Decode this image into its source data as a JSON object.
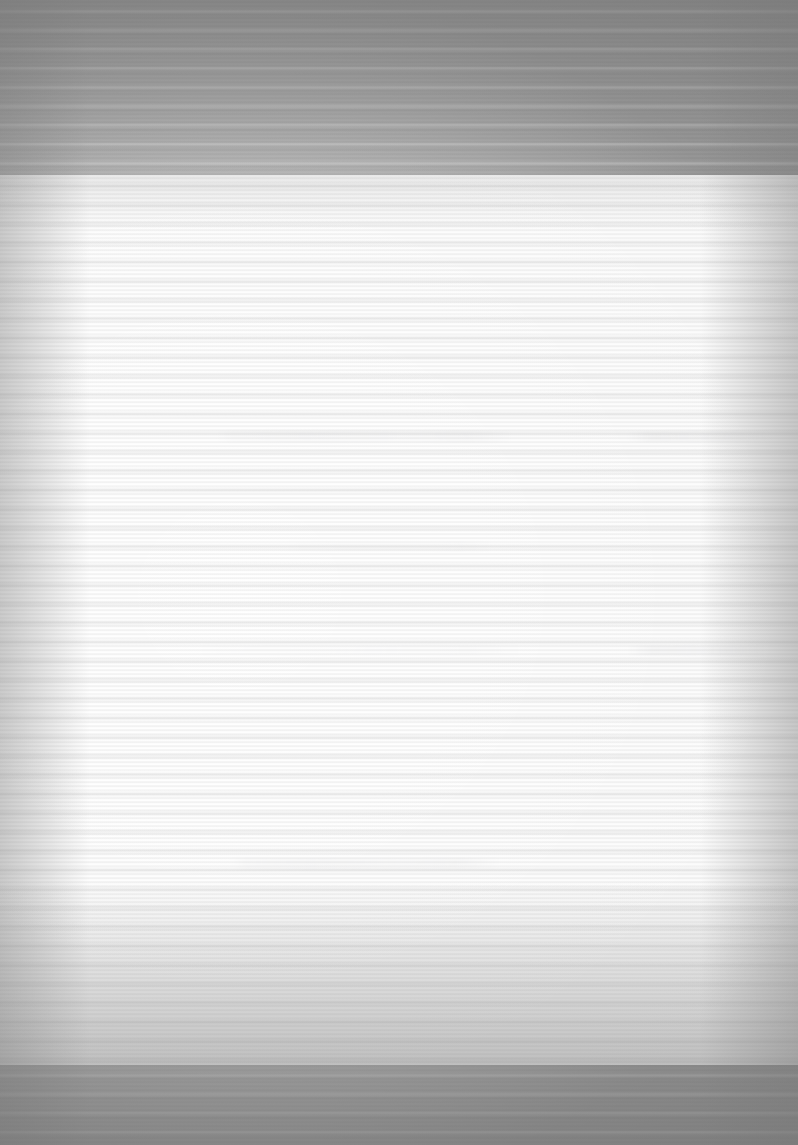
{
  "capture": {
    "width_px": 798,
    "height_px": 1145,
    "orientation": "portrait",
    "legibility": "illegible",
    "condition_note": "Severely over-exposed / washed-out scan with heavy horizontal scan-line banding and radial brightness falloff. No text glyphs are recoverable at any zoom level.",
    "colors": {
      "scanner_bed": "#909090",
      "paper": "#fafafa",
      "text_smear": "#6e6e76"
    }
  },
  "regions": {
    "top_margin_band": {
      "x": 0,
      "y": 0,
      "width": 798,
      "height": 175
    },
    "bottom_margin_band": {
      "x": 0,
      "y": 1065,
      "width": 798,
      "height": 80
    },
    "paper_area": {
      "x": 0,
      "y": 175,
      "width": 798,
      "height": 890
    },
    "text_column": {
      "x": 195,
      "y": 350,
      "width": 425,
      "height": 560
    },
    "right_margin_column": {
      "x": 620,
      "y": 350,
      "width": 170,
      "height": 560
    }
  },
  "text_lines": [
    {
      "id": "line-1",
      "role": "heading",
      "text": null,
      "legible": false,
      "x": 215,
      "y": 430,
      "width": 300,
      "height": 13
    },
    {
      "id": "line-1-right-fragment",
      "role": "margin-fragment",
      "text": null,
      "legible": false,
      "x": 625,
      "y": 431,
      "width": 150,
      "height": 11
    },
    {
      "id": "line-2",
      "role": "body",
      "text": null,
      "legible": false,
      "x": 288,
      "y": 541,
      "width": 205,
      "height": 11
    },
    {
      "id": "line-3",
      "role": "body",
      "text": null,
      "legible": false,
      "x": 200,
      "y": 644,
      "width": 320,
      "height": 12
    },
    {
      "id": "line-3-right-fragment",
      "role": "margin-fragment",
      "text": null,
      "legible": false,
      "x": 627,
      "y": 645,
      "width": 140,
      "height": 11
    },
    {
      "id": "line-4",
      "role": "body",
      "text": null,
      "legible": false,
      "x": 230,
      "y": 858,
      "width": 270,
      "height": 11
    }
  ]
}
